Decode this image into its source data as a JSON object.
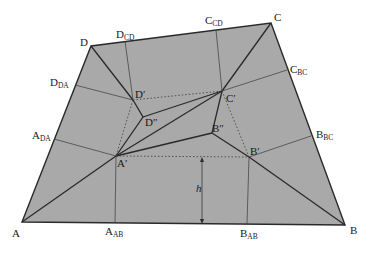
{
  "diagram": {
    "title": "",
    "colors": {
      "fill": "#a9a9a9",
      "stroke": "#2a2a2a",
      "thin": "#3a3a3a",
      "text": "#1a1a1a"
    },
    "outer_vertices": {
      "A": {
        "label": "A",
        "sub": "",
        "x": 22,
        "y": 222
      },
      "B": {
        "label": "B",
        "sub": "",
        "x": 345,
        "y": 225
      },
      "C": {
        "label": "C",
        "sub": "",
        "x": 271,
        "y": 23
      },
      "D": {
        "label": "D",
        "sub": "",
        "x": 91,
        "y": 46
      }
    },
    "edge_points": {
      "D_CD": {
        "label": "D",
        "sub": "CD",
        "x": 125,
        "y": 41
      },
      "C_CD": {
        "label": "C",
        "sub": "CD",
        "x": 216,
        "y": 30
      },
      "C_BC": {
        "label": "C",
        "sub": "BC",
        "x": 287,
        "y": 70
      },
      "B_BC": {
        "label": "B",
        "sub": "BC",
        "x": 311,
        "y": 136
      },
      "D_DA": {
        "label": "D",
        "sub": "DA",
        "x": 75,
        "y": 85
      },
      "A_DA": {
        "label": "A",
        "sub": "DA",
        "x": 54,
        "y": 139
      },
      "A_AB": {
        "label": "A",
        "sub": "AB",
        "x": 115,
        "y": 223
      },
      "B_AB": {
        "label": "B",
        "sub": "AB",
        "x": 247,
        "y": 224
      }
    },
    "inner_points": {
      "A_prime": {
        "label": "A′",
        "x": 116,
        "y": 156
      },
      "B_prime": {
        "label": "B′",
        "x": 249,
        "y": 157
      },
      "C_prime": {
        "label": "C′",
        "x": 222,
        "y": 91
      },
      "D_prime": {
        "label": "D′",
        "x": 133,
        "y": 100
      },
      "D_dprime": {
        "label": "D″",
        "x": 143,
        "y": 117
      },
      "B_dprime": {
        "label": "B″",
        "x": 212,
        "y": 133
      }
    },
    "height_marker": {
      "label": "h",
      "x": 202,
      "y_top": 157,
      "y_bottom": 224
    }
  }
}
